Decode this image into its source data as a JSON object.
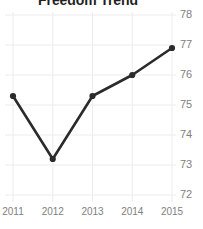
{
  "chart_data": {
    "type": "line",
    "title": "Freedom Trend",
    "xlabel": "",
    "ylabel": "",
    "categories": [
      "2011",
      "2012",
      "2013",
      "2014",
      "2015"
    ],
    "x": [
      2011,
      2012,
      2013,
      2014,
      2015
    ],
    "values": [
      75.3,
      73.2,
      75.3,
      76.0,
      76.9
    ],
    "series": [
      {
        "name": "Freedom Score",
        "values": [
          75.3,
          73.2,
          75.3,
          76.0,
          76.9
        ]
      }
    ],
    "ylim": [
      72,
      78
    ],
    "xlim": [
      2011,
      2015
    ],
    "y_ticks": [
      78,
      77,
      76,
      75,
      74,
      73,
      72
    ],
    "y_tick_labels": [
      "78",
      "77",
      "76",
      "75",
      "74",
      "73",
      "72"
    ],
    "x_ticks": [
      2011,
      2012,
      2013,
      2014,
      2015
    ],
    "x_tick_labels": [
      "2011",
      "2012",
      "2013",
      "2014",
      "2015"
    ],
    "grid": true,
    "grid_axis": "both",
    "legend": false,
    "legend_position": "none",
    "marker": "circle",
    "annotations": []
  },
  "style": {
    "line_color": "#2b2b2b",
    "marker_color": "#2b2b2b",
    "grid_color": "#ececec",
    "tick_label_color": "#808080",
    "title_color": "#1f1f1f",
    "background": "#ffffff"
  }
}
